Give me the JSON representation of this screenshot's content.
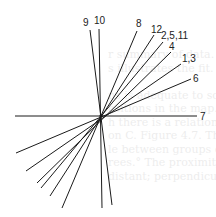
{
  "diagram": {
    "type": "vector-star",
    "center": [
      101,
      116
    ],
    "line_color": "#1a1a1a",
    "lines": [
      {
        "id": "7",
        "label": "7",
        "from": [
          15,
          116
        ],
        "to": [
          197,
          116
        ],
        "label_pos": [
          200,
          120
        ]
      },
      {
        "id": "9",
        "label": "9",
        "from": [
          112,
          205
        ],
        "to": [
          90,
          30
        ],
        "label_pos": [
          83,
          26
        ]
      },
      {
        "id": "10",
        "label": "10",
        "from": [
          102,
          208
        ],
        "to": [
          99,
          29
        ],
        "label_pos": [
          94,
          24
        ]
      },
      {
        "id": "8",
        "label": "8",
        "from": [
          62,
          208
        ],
        "to": [
          137,
          31
        ],
        "label_pos": [
          136,
          27
        ]
      },
      {
        "id": "12",
        "label": "12",
        "from": [
          50,
          196
        ],
        "to": [
          154,
          35
        ],
        "label_pos": [
          151,
          33
        ]
      },
      {
        "id": "2-5-11",
        "label": "2,5,11",
        "from": [
          41,
          188
        ],
        "to": [
          163,
          42
        ],
        "label_pos": [
          161,
          39
        ]
      },
      {
        "id": "4",
        "label": "4",
        "from": [
          37,
          183
        ],
        "to": [
          171,
          52
        ],
        "label_pos": [
          169,
          50
        ]
      },
      {
        "id": "1-3",
        "label": "1,3",
        "from": [
          26,
          171
        ],
        "to": [
          181,
          64
        ],
        "label_pos": [
          182,
          62
        ]
      },
      {
        "id": "6",
        "label": "6",
        "from": [
          16,
          153
        ],
        "to": [
          191,
          79
        ],
        "label_pos": [
          193,
          82
        ]
      }
    ]
  },
  "bleed_through_text": [
    "r summary of data. In the case of th",
    "s illustrates the fit. The table we show",
    "",
    "ns is adequate to some of the main",
    "ositions in the map.",
    "h there is a relation with the",
    "on C. Figure 4.7. The resolution",
    "le between groups of the points",
    "rees.° The proximity in the plane",
    "distant; perpendicular to angle of"
  ]
}
